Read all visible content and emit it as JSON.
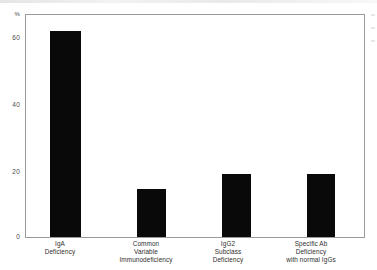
{
  "chart_data": {
    "type": "bar",
    "title": "",
    "xlabel": "",
    "ylabel": "%",
    "ylim": [
      0,
      70
    ],
    "grid": false,
    "legend": "none",
    "categories": [
      "IgA Deficiency",
      "Common Variable Immunodeficiency",
      "IgG2 Subclass Deficiency",
      "Specific Ab Deficiency with normal IgGs"
    ],
    "category_lines": [
      [
        "IgA",
        "Deficiency"
      ],
      [
        "Common",
        "Variable",
        "Immunodeficiency"
      ],
      [
        "IgG2",
        "Subclass",
        "Deficiency"
      ],
      [
        "Specific Ab",
        "Deficiency",
        "with normal IgGs"
      ]
    ],
    "values": [
      65,
      15,
      20,
      20
    ],
    "yticks": [
      "60",
      "40",
      "20",
      "0"
    ],
    "ytick_values": [
      60,
      40,
      20,
      0
    ],
    "bar_color": "#090909",
    "axis_color": "#9a9a9a"
  },
  "axis": {
    "unit_label": "%"
  }
}
